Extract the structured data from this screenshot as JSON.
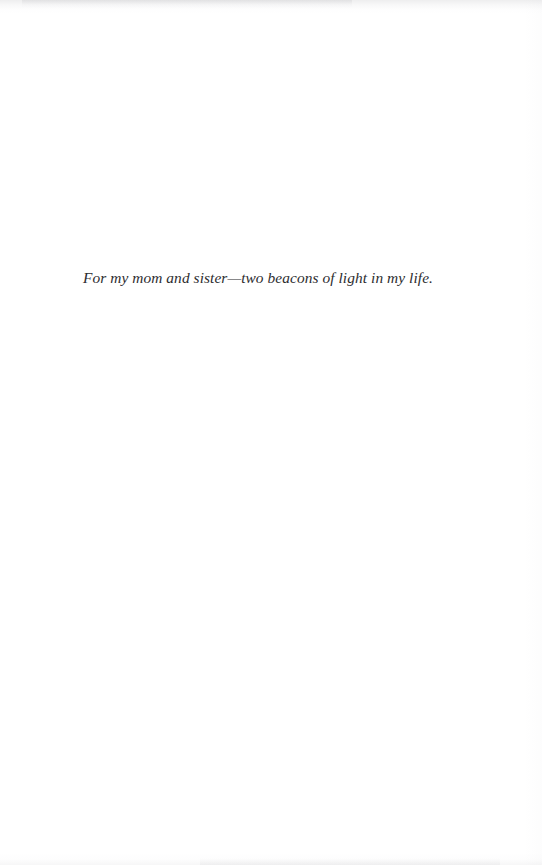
{
  "page": {
    "type": "book-dedication-page",
    "background_color": "#ffffff",
    "text_color": "#2d2d2f"
  },
  "dedication": {
    "text": "For my mom and sister—two beacons of light in my life."
  }
}
